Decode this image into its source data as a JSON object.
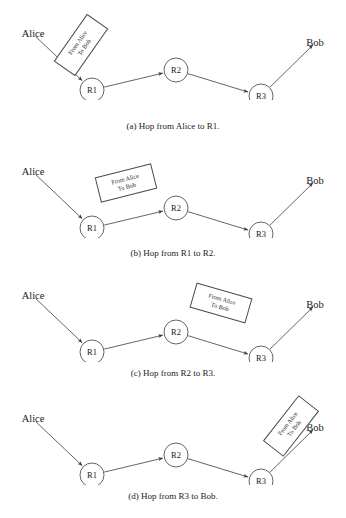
{
  "figure": {
    "width": 346,
    "height": 518,
    "background": "#ffffff",
    "line_color": "#3c3c3c",
    "text_color": "#1a1a1a"
  },
  "endpoints": {
    "source_label": "Alice",
    "destination_label": "Bob"
  },
  "routers": {
    "r1_label": "R1",
    "r2_label": "R2",
    "r3_label": "R3"
  },
  "packet": {
    "line1": "From Alice",
    "line2": "To Bob"
  },
  "panels": [
    {
      "id": "panel-a",
      "caption": "(a) Hop from Alice to R1.",
      "packet_on_link": "alice-to-r1",
      "packet_left": 52,
      "packet_top": 32,
      "packet_rotation": -55
    },
    {
      "id": "panel-b",
      "caption": "(b) Hop from R1 to R2.",
      "packet_on_link": "r1-to-r2",
      "packet_left": 97,
      "packet_top": 32,
      "packet_rotation": -14
    },
    {
      "id": "panel-c",
      "caption": "(c) Hop from R2 to R3.",
      "packet_on_link": "r2-to-r3",
      "packet_left": 192,
      "packet_top": 28,
      "packet_rotation": 16
    },
    {
      "id": "panel-d",
      "caption": "(d) Hop from R3 to Bob.",
      "packet_on_link": "r3-to-bob",
      "packet_left": 262,
      "packet_top": 28,
      "packet_rotation": -52
    }
  ],
  "topology": {
    "nodes": [
      {
        "name": "alice",
        "label": "Alice",
        "x": 33,
        "y": 34,
        "type": "endpoint"
      },
      {
        "name": "r1",
        "label": "R1",
        "x": 92,
        "y": 90,
        "r": 12,
        "type": "router"
      },
      {
        "name": "r2",
        "label": "R2",
        "x": 176,
        "y": 70,
        "r": 12,
        "type": "router"
      },
      {
        "name": "r3",
        "label": "R3",
        "x": 261,
        "y": 96,
        "r": 12,
        "type": "router"
      },
      {
        "name": "bob",
        "label": "Bob",
        "x": 315,
        "y": 43,
        "type": "endpoint"
      }
    ],
    "links": [
      {
        "name": "alice-to-r1",
        "from": "alice",
        "to": "r1",
        "direction": "forward"
      },
      {
        "name": "r1-to-r2",
        "from": "r1",
        "to": "r2",
        "direction": "forward"
      },
      {
        "name": "r2-to-r3",
        "from": "r2",
        "to": "r3",
        "direction": "forward"
      },
      {
        "name": "r3-to-bob",
        "from": "r3",
        "to": "bob",
        "direction": "forward"
      }
    ]
  },
  "layout": {
    "panel_tops": [
      0,
      138,
      262,
      385
    ],
    "caption_tops": [
      121,
      248,
      368,
      491
    ]
  }
}
